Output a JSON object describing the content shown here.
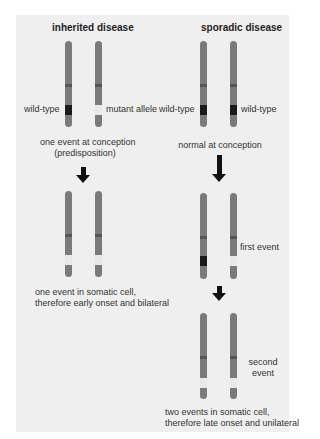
{
  "colors": {
    "background": "#efefef",
    "chromosome": "#7a7a7a",
    "centromere": "#555555",
    "wild_type_band": "#1a1a1a",
    "mutant_band": "#e8e8e8",
    "arrow": "#111111"
  },
  "left_column": {
    "title": "inherited disease",
    "stage1": {
      "label_left": "wild-type",
      "label_right": "mutant allele",
      "caption_line1": "one event at conception",
      "caption_line2": "(predisposition)"
    },
    "stage2": {
      "caption_line1": "one event in somatic cell,",
      "caption_line2": "therefore early onset and bilateral"
    }
  },
  "right_column": {
    "title": "sporadic disease",
    "stage1": {
      "label_left": "wild-type",
      "label_right": "wild-type",
      "caption": "normal at conception"
    },
    "stage2": {
      "label": "first event"
    },
    "stage3": {
      "label_line1": "second",
      "label_line2": "event",
      "caption_line1": "two events in somatic cell,",
      "caption_line2": "therefore late onset and unilateral"
    }
  }
}
